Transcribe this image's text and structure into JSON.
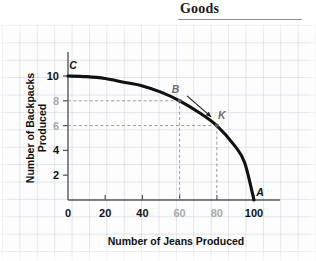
{
  "header": {
    "title": "Goods"
  },
  "chart_data": {
    "type": "line",
    "title": "",
    "xlabel": "Number of Jeans Produced",
    "ylabel": "Number of Backpacks Produced",
    "xlim": [
      0,
      110
    ],
    "ylim": [
      0,
      11
    ],
    "xticks": [
      {
        "value": 0,
        "label": "0",
        "dim": false
      },
      {
        "value": 20,
        "label": "20",
        "dim": false
      },
      {
        "value": 40,
        "label": "40",
        "dim": false
      },
      {
        "value": 60,
        "label": "60",
        "dim": true
      },
      {
        "value": 80,
        "label": "80",
        "dim": true
      },
      {
        "value": 100,
        "label": "100",
        "dim": false
      }
    ],
    "yticks": [
      {
        "value": 2,
        "label": "2",
        "dim": false
      },
      {
        "value": 4,
        "label": "4",
        "dim": false
      },
      {
        "value": 6,
        "label": "6",
        "dim": true
      },
      {
        "value": 8,
        "label": "8",
        "dim": true
      },
      {
        "value": 10,
        "label": "10",
        "dim": false
      }
    ],
    "grid": true,
    "legend": "none",
    "series": [
      {
        "name": "Production Possibilities Frontier",
        "x": [
          0,
          10,
          20,
          30,
          40,
          50,
          60,
          70,
          80,
          90,
          95,
          100
        ],
        "y": [
          10,
          9.95,
          9.8,
          9.5,
          9.2,
          8.7,
          8.0,
          7.1,
          6.0,
          4.3,
          3.0,
          0
        ]
      }
    ],
    "points": [
      {
        "label": "C",
        "x": 0,
        "y": 10,
        "dot": false,
        "dim": false,
        "label_dx": 5,
        "label_dy": -7
      },
      {
        "label": "B",
        "x": 60,
        "y": 8,
        "dot": true,
        "dim": true,
        "label_dx": -4,
        "label_dy": -8
      },
      {
        "label": "K",
        "x": 80,
        "y": 6,
        "dot": true,
        "dim": true,
        "label_dx": 5,
        "label_dy": -7
      },
      {
        "label": "A",
        "x": 100,
        "y": 0,
        "dot": false,
        "dim": false,
        "label_dx": 6,
        "label_dy": -4
      }
    ],
    "guides": [
      {
        "point": "B",
        "x": 60,
        "y": 8
      },
      {
        "point": "K",
        "x": 80,
        "y": 6
      }
    ],
    "annotations": [
      {
        "type": "arrow",
        "from": "B",
        "to": "K",
        "from_x": 64,
        "from_y": 8.4,
        "to_x": 77,
        "to_y": 6.7
      }
    ],
    "colors": {
      "curve": "#111111",
      "axis": "#555a5e",
      "guide": "#9a9a9a",
      "grid": "#b7c3d2",
      "text": "#111111"
    }
  }
}
